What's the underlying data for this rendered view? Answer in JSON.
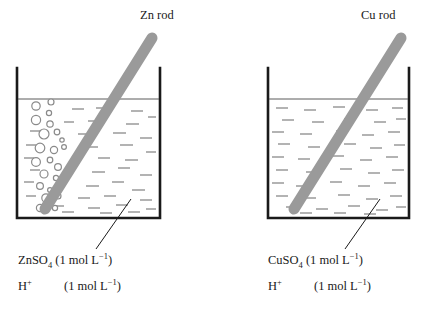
{
  "figure": {
    "type": "electrochemistry-half-cell-diagram",
    "background_color": "#ffffff",
    "stroke_color": "#1a1a1a",
    "rod_color": "#9a9a9a",
    "dash_color": "#8a8a8a",
    "bubble_stroke_color": "#8a8a8a"
  },
  "left_cell": {
    "name": "zinc-half-cell",
    "rod_label": "Zn rod",
    "electrode_material": "Zn",
    "has_bubbles": true,
    "solution": {
      "salt_name": "ZnSO",
      "salt_sub": "4",
      "salt_conc": "(1 mol L",
      "salt_conc_sup": "−1",
      "salt_conc_end": ")",
      "acid_name": "H",
      "acid_sup": "+",
      "acid_conc": "(1 mol L",
      "acid_conc_sup": "−1",
      "acid_conc_end": ")"
    }
  },
  "right_cell": {
    "name": "copper-half-cell",
    "rod_label": "Cu rod",
    "electrode_material": "Cu",
    "has_bubbles": false,
    "solution": {
      "salt_name": "CuSO",
      "salt_sub": "4",
      "salt_conc": "(1 mol L",
      "salt_conc_sup": "−1",
      "salt_conc_end": ")",
      "acid_name": "H",
      "acid_sup": "+",
      "acid_conc": "(1 mol L",
      "acid_conc_sup": "−1",
      "acid_conc_end": ")"
    }
  }
}
